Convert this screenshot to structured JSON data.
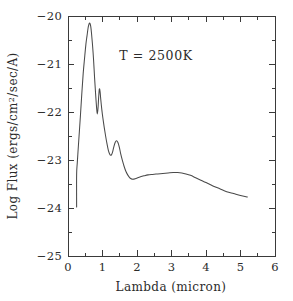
{
  "chart_data": {
    "type": "line",
    "title": "",
    "xlabel": "Lambda (micron)",
    "ylabel": "Log Flux (ergs/cm2/sec/A)",
    "ylabel_parts": {
      "pre": "Log Flux (ergs/cm",
      "sup": "2",
      "post": "/sec/A)"
    },
    "xlim": [
      0,
      6
    ],
    "ylim": [
      -25,
      -20
    ],
    "xticks": [
      0,
      1,
      2,
      3,
      4,
      5,
      6
    ],
    "xtick_labels": [
      "0",
      "1",
      "2",
      "3",
      "4",
      "5",
      "6"
    ],
    "xticks_minor": [
      0.5,
      1.5,
      2.5,
      3.5,
      4.5,
      5.5
    ],
    "yticks": [
      -25,
      -24,
      -23,
      -22,
      -21,
      -20
    ],
    "ytick_labels": [
      "-25",
      "-24",
      "-23",
      "-22",
      "-21",
      "-20"
    ],
    "yticks_minor": [
      -24.5,
      -23.5,
      -22.5,
      -21.5,
      -20.5
    ],
    "grid": false,
    "legend": null,
    "line_color": "#4a4a4a",
    "background_color": "#ffffff",
    "annotations": [
      {
        "text": "T = 2500K",
        "x": 2.55,
        "y": -20.92
      }
    ],
    "series": [
      {
        "name": "model spectrum 2500K",
        "x": [
          0.25,
          0.25,
          0.27,
          0.3,
          0.33,
          0.36,
          0.4,
          0.44,
          0.48,
          0.52,
          0.55,
          0.58,
          0.6,
          0.62,
          0.64,
          0.66,
          0.68,
          0.71,
          0.74,
          0.77,
          0.8,
          0.83,
          0.85,
          0.87,
          0.89,
          0.91,
          0.93,
          0.95,
          0.98,
          1.01,
          1.05,
          1.09,
          1.13,
          1.17,
          1.21,
          1.25,
          1.29,
          1.33,
          1.37,
          1.41,
          1.45,
          1.49,
          1.53,
          1.58,
          1.63,
          1.68,
          1.73,
          1.78,
          1.83,
          1.88,
          1.95,
          2.02,
          2.1,
          2.2,
          2.32,
          2.45,
          2.6,
          2.75,
          2.9,
          3.05,
          3.18,
          3.3,
          3.42,
          3.55,
          3.7,
          3.85,
          4.0,
          4.2,
          4.4,
          4.6,
          4.8,
          5.0,
          5.2
        ],
        "y": [
          -23.98,
          -23.3,
          -23.05,
          -22.72,
          -22.4,
          -22.08,
          -21.62,
          -21.2,
          -20.88,
          -20.58,
          -20.42,
          -20.26,
          -20.19,
          -20.15,
          -20.16,
          -20.22,
          -20.35,
          -20.6,
          -20.9,
          -21.28,
          -21.62,
          -21.92,
          -22.04,
          -21.92,
          -21.68,
          -21.52,
          -21.58,
          -21.74,
          -21.95,
          -22.12,
          -22.32,
          -22.5,
          -22.66,
          -22.8,
          -22.88,
          -22.9,
          -22.84,
          -22.72,
          -22.63,
          -22.6,
          -22.64,
          -22.74,
          -22.88,
          -23.02,
          -23.14,
          -23.24,
          -23.31,
          -23.36,
          -23.39,
          -23.4,
          -23.39,
          -23.37,
          -23.35,
          -23.33,
          -23.31,
          -23.3,
          -23.29,
          -23.28,
          -23.27,
          -23.26,
          -23.26,
          -23.27,
          -23.29,
          -23.32,
          -23.37,
          -23.42,
          -23.47,
          -23.54,
          -23.6,
          -23.66,
          -23.7,
          -23.74,
          -23.77
        ]
      }
    ]
  },
  "figure": {
    "plot_area": {
      "left": 68,
      "top": 16,
      "right": 275,
      "bottom": 256
    }
  }
}
